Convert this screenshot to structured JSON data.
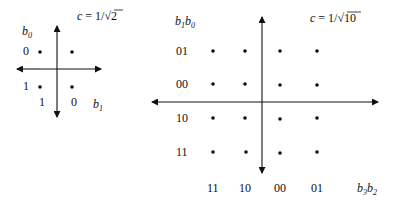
{
  "left_diagram": {
    "name": "BPSK/QPSK constellation (2 bits)",
    "scale_formula": "c = 1/√2",
    "scale_lhs": "c",
    "scale_rhs_num": "1/",
    "scale_rhs_rad": "2",
    "vertical_axis_label": {
      "base": "b",
      "sub": "0"
    },
    "horizontal_axis_label": {
      "base": "b",
      "sub": "1"
    },
    "row_labels": [
      "0",
      "1"
    ],
    "column_labels": [
      "1",
      "0"
    ],
    "points": [
      {
        "row": "0",
        "col": "1"
      },
      {
        "row": "0",
        "col": "0"
      },
      {
        "row": "1",
        "col": "1"
      },
      {
        "row": "1",
        "col": "0"
      }
    ]
  },
  "right_diagram": {
    "name": "16-QAM constellation (4 bits)",
    "scale_formula": "c = 1/√10",
    "scale_lhs": "c",
    "scale_rhs_num": "1/",
    "scale_rhs_rad": "10",
    "vertical_axis_label": {
      "b1": "b",
      "s1": "1",
      "b0": "b",
      "s0": "0"
    },
    "horizontal_axis_label": {
      "b3": "b",
      "s3": "3",
      "b2": "b",
      "s2": "2"
    },
    "row_labels": [
      "01",
      "00",
      "10",
      "11"
    ],
    "column_labels": [
      "11",
      "10",
      "00",
      "01"
    ],
    "grid": "4x4 points"
  }
}
